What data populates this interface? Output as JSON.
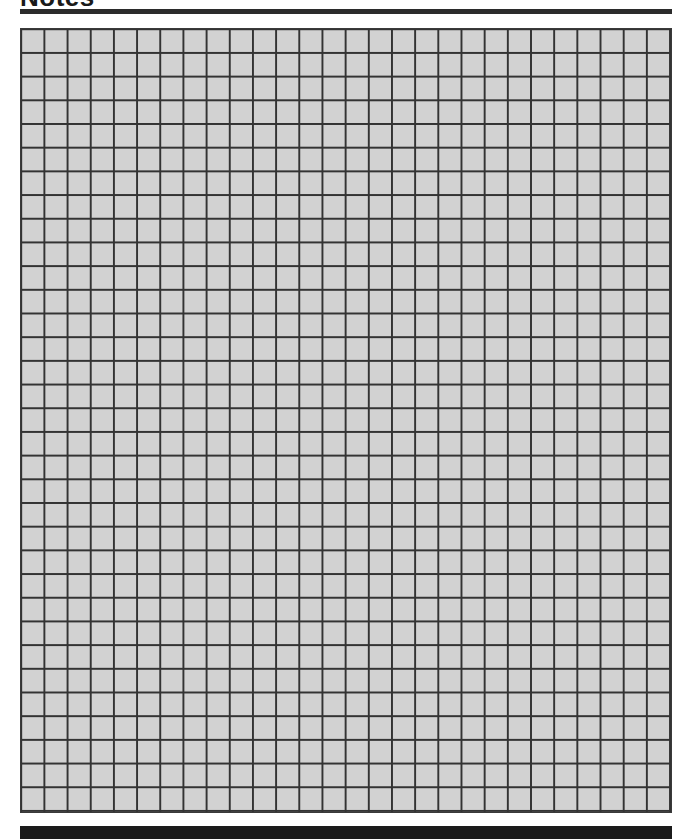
{
  "page": {
    "title": "Notes"
  },
  "grid": {
    "columns": 28,
    "rows": 33,
    "fill_color": "#d2d2d2",
    "line_color": "#333333"
  },
  "colors": {
    "title_rule": "#2b2b2b",
    "footer_bar": "#1b1b1b",
    "background": "#ffffff"
  }
}
